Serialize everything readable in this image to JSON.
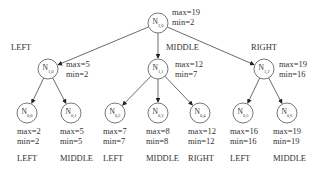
{
  "diagram": {
    "type": "tree",
    "nodes": [
      {
        "id": "root",
        "name": "N",
        "sub": "2,0",
        "max": "max=19",
        "min": "min=2",
        "cx": 158,
        "cy": 23
      },
      {
        "id": "n10",
        "name": "N",
        "sub": "1,0",
        "max": "max=5",
        "min": "min=2",
        "cx": 48,
        "cy": 69,
        "edge_label": "LEFT"
      },
      {
        "id": "n11",
        "name": "N",
        "sub": "1,1",
        "max": "max=12",
        "min": "min=7",
        "cx": 158,
        "cy": 69,
        "edge_label": "MIDDLE"
      },
      {
        "id": "n12",
        "name": "N",
        "sub": "1,2",
        "max": "max=19",
        "min": "min=16",
        "cx": 264,
        "cy": 69,
        "edge_label": "RIGHT"
      },
      {
        "id": "n00",
        "name": "N",
        "sub": "0,0",
        "max": "max=2",
        "min": "min=2",
        "cx": 27,
        "cy": 113,
        "edge_label": "LEFT"
      },
      {
        "id": "n01",
        "name": "N",
        "sub": "0,1",
        "max": "max=5",
        "min": "min=5",
        "cx": 71,
        "cy": 113,
        "edge_label": "MIDDLE"
      },
      {
        "id": "n02",
        "name": "N",
        "sub": "0,2",
        "max": "max=7",
        "min": "min=7",
        "cx": 115,
        "cy": 113,
        "edge_label": "LEFT"
      },
      {
        "id": "n03",
        "name": "N",
        "sub": "0,3",
        "max": "max=8",
        "min": "min=8",
        "cx": 158,
        "cy": 113,
        "edge_label": "MIDDLE"
      },
      {
        "id": "n04",
        "name": "N",
        "sub": "0,4",
        "max": "max=12",
        "min": "min=12",
        "cx": 200,
        "cy": 113,
        "edge_label": "RIGHT"
      },
      {
        "id": "n05",
        "name": "N",
        "sub": "0,5",
        "max": "max=16",
        "min": "min=16",
        "cx": 243,
        "cy": 113,
        "edge_label": "LEFT"
      },
      {
        "id": "n06",
        "name": "N",
        "sub": "0,6",
        "max": "max=19",
        "min": "min=19",
        "cx": 287,
        "cy": 113,
        "edge_label": "MIDDLE"
      }
    ],
    "edges": [
      [
        "root",
        "n10"
      ],
      [
        "root",
        "n11"
      ],
      [
        "root",
        "n12"
      ],
      [
        "n10",
        "n00"
      ],
      [
        "n10",
        "n01"
      ],
      [
        "n11",
        "n02"
      ],
      [
        "n11",
        "n03"
      ],
      [
        "n11",
        "n04"
      ],
      [
        "n12",
        "n05"
      ],
      [
        "n12",
        "n06"
      ]
    ]
  }
}
